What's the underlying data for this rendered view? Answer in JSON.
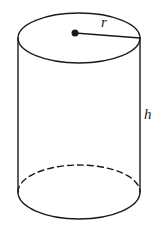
{
  "figure": {
    "kind": "geometry-diagram",
    "shape": "cylinder",
    "background_color": "#ffffff",
    "stroke_color": "#1a1a1a",
    "canvas": {
      "width": 159,
      "height": 230
    }
  },
  "labels": {
    "radius": "r",
    "height": "h"
  },
  "geometry": {
    "top_ellipse": {
      "cx": 79,
      "cy": 38,
      "rx": 61,
      "ry": 25
    },
    "bottom_ellipse": {
      "cx": 79,
      "cy": 192,
      "rx": 61,
      "ry": 27
    },
    "left_side_line": {
      "x1": 18,
      "y1": 38,
      "x2": 18,
      "y2": 192
    },
    "right_side_line": {
      "x1": 140,
      "y1": 38,
      "x2": 140,
      "y2": 192
    },
    "center_dot": {
      "cx": 75,
      "cy": 33,
      "r": 3.5
    },
    "radius_line": {
      "x1": 75,
      "y1": 33,
      "x2": 140,
      "y2": 38
    },
    "hidden_back_arc_style": "dashed",
    "visible_front_arc_style": "solid",
    "stroke_width": 1.4,
    "dash_pattern": "6 4"
  }
}
